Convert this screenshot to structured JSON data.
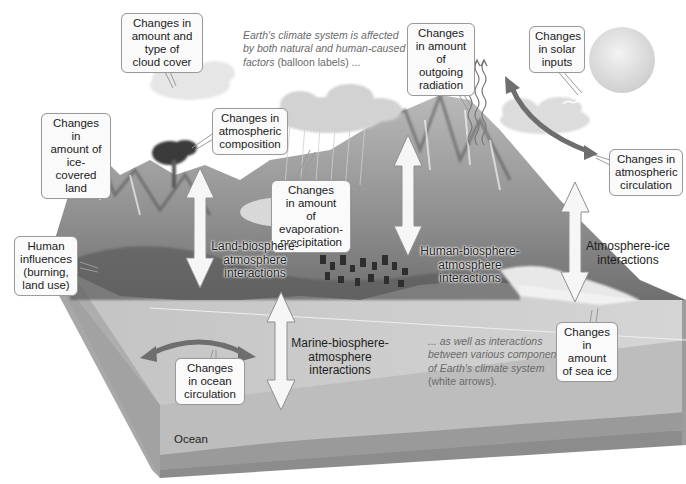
{
  "figure": {
    "description_top": {
      "italic": "Earth's climate system is affected\nby both natural and human-caused\nfactors",
      "plain": " (balloon labels) ..."
    },
    "description_bottom": {
      "italic": "... as well as interactions\nbetween various components\nof Earth's climate system\n",
      "plain": "(white arrows)."
    },
    "balloons": {
      "cloud_cover": "Changes in\namount and\ntype of\ncloud cover",
      "atmospheric_composition": "Changes in\natmospheric\ncomposition",
      "ice_covered_land": "Changes in\namount of\nice-covered\nland",
      "outgoing_radiation": "Changes\nin amount\nof outgoing\nradiation",
      "solar_inputs": "Changes\nin solar\ninputs",
      "atmospheric_circulation": "Changes in\natmospheric\ncirculation",
      "evaporation_precipitation": "Changes\nin amount\nof evaporation-\nprecipitation",
      "human_influences": "Human\ninfluences\n(burning,\nland use)",
      "ocean_circulation": "Changes\nin ocean\ncirculation",
      "sea_ice": "Changes\nin amount\nof sea ice"
    },
    "interactions": {
      "land": "Land-biosphere-\natmosphere\ninteractions",
      "human": "Human-biosphere-\natmosphere\ninteractions",
      "atmosphere_ice": "Atmosphere-ice\ninteractions",
      "marine": "Marine-biosphere-\natmosphere\ninteractions"
    },
    "ocean_label": "Ocean",
    "colors": {
      "background": "#ffffff",
      "ocean_surface": "#c9c9c9",
      "ocean_side": "#b5b5b5",
      "ocean_floor": "#8a8a8a",
      "land": "#9a9a9a",
      "arrow_dark": "#6e6e6e",
      "arrow_white": "#f4f4f4",
      "sun": "#e2e2e2"
    }
  }
}
